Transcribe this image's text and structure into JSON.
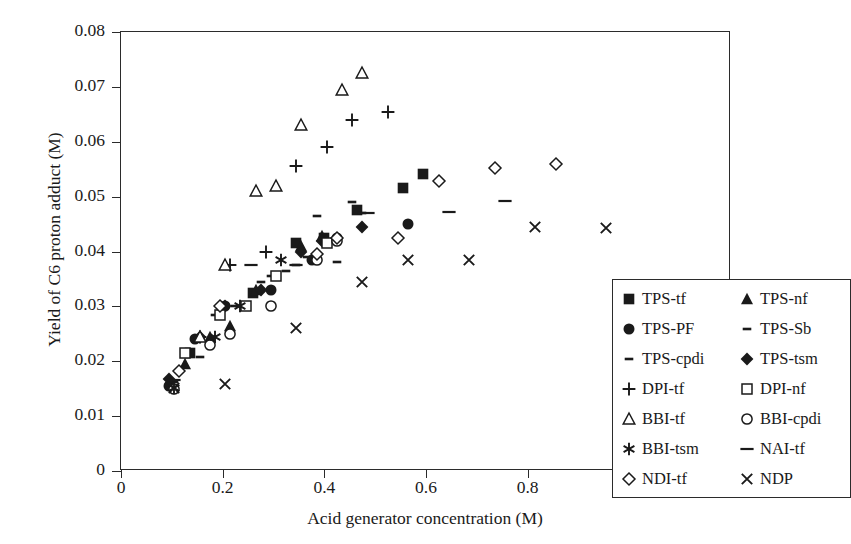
{
  "chart_data": {
    "type": "scatter",
    "title": "",
    "xlabel": "Acid generator concentration (M)",
    "ylabel": "Yield of C6 proton adduct (M)",
    "xlim": [
      0,
      1.2
    ],
    "ylim": [
      0,
      0.08
    ],
    "xticks": [
      "0",
      "0.2",
      "0.4",
      "0.6",
      "0.8",
      "1",
      "1.2"
    ],
    "xtick_values": [
      0,
      0.2,
      0.4,
      0.6,
      0.8,
      1.0,
      1.2
    ],
    "yticks": [
      "0",
      "0.01",
      "0.02",
      "0.03",
      "0.04",
      "0.05",
      "0.06",
      "0.07",
      "0.08"
    ],
    "ytick_values": [
      0,
      0.01,
      0.02,
      0.03,
      0.04,
      0.05,
      0.06,
      0.07,
      0.08
    ],
    "grid": false,
    "legend_position": "lower-right",
    "marker_color": "#1a1a1a",
    "series": [
      {
        "name": "TPS-tf",
        "marker": "filled-square",
        "points": [
          [
            0.135,
            0.0215
          ],
          [
            0.26,
            0.0325
          ],
          [
            0.345,
            0.0415
          ],
          [
            0.4,
            0.0425
          ],
          [
            0.465,
            0.0475
          ],
          [
            0.555,
            0.0515
          ],
          [
            0.595,
            0.0542
          ]
        ]
      },
      {
        "name": "TPS-nf",
        "marker": "filled-triangle",
        "points": [
          [
            0.125,
            0.0195
          ],
          [
            0.175,
            0.0245
          ],
          [
            0.215,
            0.0265
          ],
          [
            0.265,
            0.033
          ],
          [
            0.355,
            0.041
          ],
          [
            0.395,
            0.0428
          ]
        ]
      },
      {
        "name": "TPS-PF",
        "marker": "filled-circle",
        "points": [
          [
            0.095,
            0.0155
          ],
          [
            0.145,
            0.024
          ],
          [
            0.205,
            0.03
          ],
          [
            0.295,
            0.033
          ],
          [
            0.375,
            0.0385
          ],
          [
            0.425,
            0.0425
          ],
          [
            0.565,
            0.045
          ]
        ]
      },
      {
        "name": "TPS-Sb",
        "marker": "dash-short",
        "points": [
          [
            0.105,
            0.0163
          ],
          [
            0.155,
            0.0208
          ],
          [
            0.225,
            0.03
          ],
          [
            0.295,
            0.0355
          ],
          [
            0.345,
            0.0375
          ],
          [
            0.385,
            0.0465
          ],
          [
            0.455,
            0.049
          ]
        ]
      },
      {
        "name": "TPS-cpdi",
        "marker": "dash-short",
        "points": [
          [
            0.185,
            0.0285
          ],
          [
            0.275,
            0.0345
          ],
          [
            0.325,
            0.0365
          ],
          [
            0.365,
            0.039
          ],
          [
            0.425,
            0.038
          ],
          [
            0.475,
            0.047
          ]
        ]
      },
      {
        "name": "TPS-tsm",
        "marker": "filled-diamond",
        "points": [
          [
            0.095,
            0.0168
          ],
          [
            0.155,
            0.0245
          ],
          [
            0.205,
            0.03
          ],
          [
            0.275,
            0.033
          ],
          [
            0.355,
            0.04
          ],
          [
            0.395,
            0.042
          ],
          [
            0.475,
            0.0445
          ]
        ]
      },
      {
        "name": "DPI-tf",
        "marker": "plus",
        "points": [
          [
            0.155,
            0.0245
          ],
          [
            0.215,
            0.0375
          ],
          [
            0.285,
            0.04
          ],
          [
            0.345,
            0.0555
          ],
          [
            0.405,
            0.059
          ],
          [
            0.455,
            0.064
          ],
          [
            0.525,
            0.0655
          ]
        ]
      },
      {
        "name": "DPI-nf",
        "marker": "open-square",
        "points": [
          [
            0.125,
            0.0215
          ],
          [
            0.195,
            0.0285
          ],
          [
            0.245,
            0.03
          ],
          [
            0.305,
            0.0355
          ],
          [
            0.405,
            0.0415
          ]
        ]
      },
      {
        "name": "BBI-tf",
        "marker": "open-triangle",
        "points": [
          [
            0.155,
            0.0245
          ],
          [
            0.205,
            0.0375
          ],
          [
            0.265,
            0.051
          ],
          [
            0.305,
            0.052
          ],
          [
            0.355,
            0.063
          ],
          [
            0.435,
            0.0695
          ],
          [
            0.475,
            0.0725
          ]
        ]
      },
      {
        "name": "BBI-cpdi",
        "marker": "open-circle",
        "points": [
          [
            0.105,
            0.015
          ],
          [
            0.175,
            0.023
          ],
          [
            0.215,
            0.025
          ],
          [
            0.295,
            0.03
          ],
          [
            0.385,
            0.0385
          ],
          [
            0.425,
            0.042
          ]
        ]
      },
      {
        "name": "BBI-tsm",
        "marker": "asterisk",
        "points": [
          [
            0.105,
            0.0152
          ],
          [
            0.185,
            0.0245
          ],
          [
            0.235,
            0.03
          ],
          [
            0.315,
            0.0385
          ]
        ]
      },
      {
        "name": "NAI-tf",
        "marker": "dash-long",
        "points": [
          [
            0.105,
            0.0165
          ],
          [
            0.255,
            0.0375
          ],
          [
            0.345,
            0.0375
          ],
          [
            0.485,
            0.047
          ],
          [
            0.645,
            0.0472
          ],
          [
            0.755,
            0.0492
          ]
        ]
      },
      {
        "name": "NDI-tf",
        "marker": "open-diamond",
        "points": [
          [
            0.115,
            0.0183
          ],
          [
            0.195,
            0.03
          ],
          [
            0.385,
            0.0395
          ],
          [
            0.425,
            0.0425
          ],
          [
            0.545,
            0.0425
          ],
          [
            0.625,
            0.0528
          ],
          [
            0.735,
            0.0552
          ],
          [
            0.855,
            0.056
          ]
        ]
      },
      {
        "name": "NDP",
        "marker": "cross-x",
        "points": [
          [
            0.105,
            0.0152
          ],
          [
            0.205,
            0.0158
          ],
          [
            0.345,
            0.026
          ],
          [
            0.475,
            0.0345
          ],
          [
            0.565,
            0.0385
          ],
          [
            0.685,
            0.0385
          ],
          [
            0.815,
            0.0445
          ],
          [
            0.955,
            0.0443
          ]
        ]
      }
    ],
    "legend_items": [
      {
        "label": "TPS-tf",
        "marker": "filled-square"
      },
      {
        "label": "TPS-nf",
        "marker": "filled-triangle"
      },
      {
        "label": "TPS-PF",
        "marker": "filled-circle"
      },
      {
        "label": "TPS-Sb",
        "marker": "dash-short"
      },
      {
        "label": "TPS-cpdi",
        "marker": "dash-short"
      },
      {
        "label": "TPS-tsm",
        "marker": "filled-diamond"
      },
      {
        "label": "DPI-tf",
        "marker": "plus"
      },
      {
        "label": "DPI-nf",
        "marker": "open-square"
      },
      {
        "label": "BBI-tf",
        "marker": "open-triangle"
      },
      {
        "label": "BBI-cpdi",
        "marker": "open-circle"
      },
      {
        "label": "BBI-tsm",
        "marker": "asterisk"
      },
      {
        "label": "NAI-tf",
        "marker": "dash-long"
      },
      {
        "label": "NDI-tf",
        "marker": "open-diamond"
      },
      {
        "label": "NDP",
        "marker": "cross-x"
      }
    ]
  }
}
